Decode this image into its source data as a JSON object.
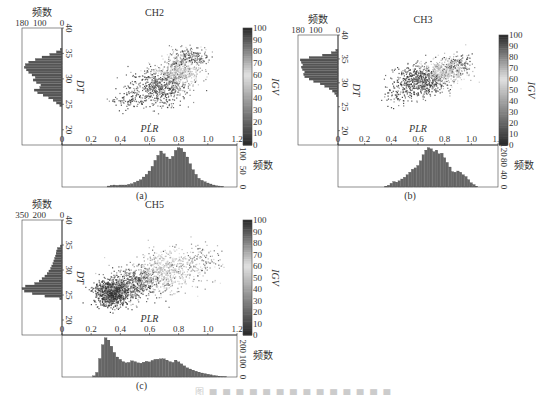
{
  "figure": {
    "caption": "图 ■ ■ ■ ■ ■ ■ ■ ■ ■ ■ ■ ■ ■ ■"
  },
  "chart_data": [
    {
      "type": "scatter",
      "panel_label": "(a)",
      "title": "CH2",
      "xlabel": "PLR",
      "ylabel": "DT",
      "colorbar_label": "IGV",
      "xlim": [
        0,
        1.2
      ],
      "ylim": [
        17,
        40
      ],
      "x_ticks": [
        "0",
        "0.2",
        "0.4",
        "0.6",
        "0.8",
        "1.0",
        "1.2"
      ],
      "y_ticks": [
        "20",
        "25",
        "30",
        "35",
        "40"
      ],
      "colorbar_ticks": [
        "0",
        "10",
        "20",
        "30",
        "40",
        "50",
        "60",
        "70",
        "80",
        "90",
        "100"
      ],
      "colorbar_range": [
        0,
        100
      ],
      "scatter_clusters": [
        {
          "x_mean": 0.66,
          "y_mean": 28.5,
          "x_sd": 0.1,
          "y_sd": 1.8,
          "igv_mean": 15,
          "n": 600
        },
        {
          "x_mean": 0.8,
          "y_mean": 31.5,
          "x_sd": 0.07,
          "y_sd": 1.4,
          "igv_mean": 62,
          "n": 450
        },
        {
          "x_mean": 0.88,
          "y_mean": 34.5,
          "x_sd": 0.07,
          "y_sd": 1.0,
          "igv_mean": 88,
          "n": 180
        },
        {
          "x_mean": 0.45,
          "y_mean": 26.0,
          "x_sd": 0.06,
          "y_sd": 1.0,
          "igv_mean": 10,
          "n": 80
        }
      ],
      "left_hist": {
        "label": "频数",
        "ticks": [
          "180",
          "100",
          "0"
        ],
        "max": 180,
        "bins_dt": [
          24.5,
          25,
          25.5,
          26,
          26.5,
          27,
          27.5,
          28,
          28.5,
          29,
          29.5,
          30,
          30.5,
          31,
          31.5,
          32,
          32.5,
          33,
          33.5,
          34,
          34.5,
          35,
          35.5
        ],
        "values": [
          10,
          25,
          40,
          60,
          85,
          110,
          125,
          100,
          95,
          115,
          130,
          120,
          135,
          150,
          160,
          170,
          165,
          150,
          120,
          90,
          55,
          25,
          8
        ]
      },
      "bottom_hist": {
        "label": "频数",
        "ticks": [
          "0",
          "50",
          "100"
        ],
        "max": 120,
        "bins_plr": [
          0.32,
          0.34,
          0.36,
          0.38,
          0.4,
          0.42,
          0.44,
          0.46,
          0.48,
          0.5,
          0.52,
          0.54,
          0.56,
          0.58,
          0.6,
          0.62,
          0.64,
          0.66,
          0.68,
          0.7,
          0.72,
          0.74,
          0.76,
          0.78,
          0.8,
          0.82,
          0.84,
          0.86,
          0.88,
          0.9,
          0.92,
          0.94,
          0.96,
          0.98,
          1.0,
          1.02,
          1.04,
          1.06,
          1.08,
          1.1
        ],
        "values": [
          3,
          5,
          6,
          5,
          6,
          6,
          6,
          8,
          10,
          14,
          18,
          22,
          30,
          38,
          48,
          62,
          80,
          95,
          108,
          100,
          90,
          84,
          92,
          110,
          118,
          116,
          105,
          90,
          70,
          52,
          38,
          26,
          20,
          16,
          12,
          9,
          6,
          4,
          3,
          2
        ]
      }
    },
    {
      "type": "scatter",
      "panel_label": "(b)",
      "title": "CH3",
      "xlabel": "PLR",
      "ylabel": "DT",
      "colorbar_label": "IGV",
      "xlim": [
        0,
        1.2
      ],
      "ylim": [
        17,
        40
      ],
      "x_ticks": [
        "0",
        "0.2",
        "0.4",
        "0.6",
        "0.8",
        "1.0",
        "1.2"
      ],
      "y_ticks": [
        "20",
        "25",
        "30",
        "35",
        "40"
      ],
      "colorbar_ticks": [
        "0",
        "10",
        "20",
        "30",
        "40",
        "50",
        "60",
        "70",
        "80",
        "90",
        "100"
      ],
      "colorbar_range": [
        0,
        100
      ],
      "scatter_clusters": [
        {
          "x_mean": 0.62,
          "y_mean": 30.5,
          "x_sd": 0.09,
          "y_sd": 1.5,
          "igv_mean": 12,
          "n": 600
        },
        {
          "x_mean": 0.8,
          "y_mean": 32.5,
          "x_sd": 0.08,
          "y_sd": 1.3,
          "igv_mean": 60,
          "n": 400
        },
        {
          "x_mean": 0.9,
          "y_mean": 34.0,
          "x_sd": 0.05,
          "y_sd": 1.0,
          "igv_mean": 85,
          "n": 120
        },
        {
          "x_mean": 0.45,
          "y_mean": 28.0,
          "x_sd": 0.06,
          "y_sd": 1.2,
          "igv_mean": 10,
          "n": 80
        }
      ],
      "left_hist": {
        "label": "频数",
        "ticks": [
          "180",
          "100",
          "0"
        ],
        "max": 180,
        "bins_dt": [
          27,
          27.5,
          28,
          28.5,
          29,
          29.5,
          30,
          30.5,
          31,
          31.5,
          32,
          32.5,
          33,
          33.5,
          34,
          34.5,
          35,
          35.5,
          36,
          36.5
        ],
        "values": [
          8,
          15,
          25,
          40,
          60,
          80,
          110,
          130,
          150,
          155,
          150,
          160,
          165,
          158,
          165,
          170,
          130,
          70,
          30,
          10
        ]
      },
      "bottom_hist": {
        "label": "频数",
        "ticks": [
          "0",
          "40",
          "80",
          "120"
        ],
        "max": 130,
        "bins_plr": [
          0.36,
          0.38,
          0.4,
          0.42,
          0.44,
          0.46,
          0.48,
          0.5,
          0.52,
          0.54,
          0.56,
          0.58,
          0.6,
          0.62,
          0.64,
          0.66,
          0.68,
          0.7,
          0.72,
          0.74,
          0.76,
          0.78,
          0.8,
          0.82,
          0.84,
          0.86,
          0.88,
          0.9,
          0.92,
          0.94,
          0.96,
          0.98,
          1.0,
          1.02,
          1.04
        ],
        "values": [
          3,
          6,
          12,
          18,
          16,
          20,
          26,
          32,
          40,
          48,
          58,
          62,
          70,
          85,
          105,
          120,
          128,
          124,
          115,
          120,
          108,
          110,
          95,
          80,
          65,
          50,
          48,
          52,
          48,
          40,
          34,
          24,
          14,
          8,
          3
        ]
      }
    },
    {
      "type": "scatter",
      "panel_label": "(c)",
      "title": "CH5",
      "xlabel": "PLR",
      "ylabel": "DT",
      "colorbar_label": "IGV",
      "xlim": [
        0,
        1.2
      ],
      "ylim": [
        17,
        40
      ],
      "x_ticks": [
        "0",
        "0.2",
        "0.4",
        "0.6",
        "0.8",
        "1.0",
        "1.2"
      ],
      "y_ticks": [
        "20",
        "25",
        "30",
        "35",
        "40"
      ],
      "colorbar_ticks": [
        "0",
        "10",
        "20",
        "30",
        "40",
        "50",
        "60",
        "70",
        "80",
        "90",
        "100"
      ],
      "colorbar_range": [
        0,
        100
      ],
      "scatter_clusters": [
        {
          "x_mean": 0.34,
          "y_mean": 25.5,
          "x_sd": 0.06,
          "y_sd": 1.3,
          "igv_mean": 95,
          "n": 900
        },
        {
          "x_mean": 0.5,
          "y_mean": 27.5,
          "x_sd": 0.09,
          "y_sd": 1.6,
          "igv_mean": 85,
          "n": 600
        },
        {
          "x_mean": 0.7,
          "y_mean": 30.0,
          "x_sd": 0.09,
          "y_sd": 2.0,
          "igv_mean": 62,
          "n": 500
        },
        {
          "x_mean": 0.95,
          "y_mean": 31.5,
          "x_sd": 0.07,
          "y_sd": 2.0,
          "igv_mean": 75,
          "n": 150
        }
      ],
      "left_hist": {
        "label": "频数",
        "ticks": [
          "350",
          "200",
          "0"
        ],
        "max": 350,
        "bins_dt": [
          24,
          24.5,
          25,
          25.5,
          26,
          26.5,
          27,
          27.5,
          28,
          28.5,
          29,
          29.5,
          30,
          30.5,
          31,
          31.5,
          32,
          32.5,
          33,
          33.5,
          34,
          34.5
        ],
        "values": [
          20,
          150,
          260,
          330,
          350,
          320,
          240,
          200,
          175,
          150,
          130,
          115,
          100,
          90,
          80,
          72,
          65,
          58,
          52,
          48,
          40,
          15
        ]
      },
      "bottom_hist": {
        "label": "频数",
        "ticks": [
          "0",
          "100",
          "200"
        ],
        "max": 260,
        "bins_plr": [
          0.22,
          0.24,
          0.26,
          0.28,
          0.3,
          0.32,
          0.34,
          0.36,
          0.38,
          0.4,
          0.42,
          0.44,
          0.46,
          0.48,
          0.5,
          0.52,
          0.54,
          0.56,
          0.58,
          0.6,
          0.62,
          0.64,
          0.66,
          0.68,
          0.7,
          0.72,
          0.74,
          0.76,
          0.78,
          0.8,
          0.82,
          0.84,
          0.86,
          0.88,
          0.9,
          0.92,
          0.94,
          0.96,
          0.98,
          1.0,
          1.02,
          1.04,
          1.06,
          1.08,
          1.1,
          1.12
        ],
        "values": [
          8,
          30,
          120,
          210,
          255,
          240,
          200,
          160,
          130,
          115,
          100,
          92,
          95,
          105,
          100,
          92,
          90,
          96,
          102,
          98,
          108,
          115,
          116,
          118,
          118,
          110,
          100,
          95,
          110,
          98,
          85,
          72,
          60,
          52,
          45,
          38,
          32,
          26,
          22,
          18,
          14,
          10,
          8,
          6,
          4,
          3
        ]
      }
    }
  ]
}
